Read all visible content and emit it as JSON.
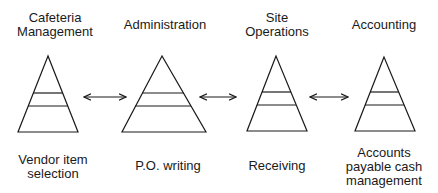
{
  "diagram": {
    "type": "linked-pyramids",
    "stroke_color": "#1a1a1a",
    "background": "#ffffff",
    "columns": [
      {
        "top_label": "Cafeteria\nManagement",
        "bottom_label": "Vendor item\nselection"
      },
      {
        "top_label": "Administration",
        "bottom_label": "P.O. writing"
      },
      {
        "top_label": "Site\nOperations",
        "bottom_label": "Receiving"
      },
      {
        "top_label": "Accounting",
        "bottom_label": "Accounts\npayable cash\nmanagement"
      }
    ],
    "connectors": [
      {
        "from": "Cafeteria Management",
        "to": "Administration",
        "style": "double-headed-arrow"
      },
      {
        "from": "Administration",
        "to": "Site Operations",
        "style": "double-headed-arrow"
      },
      {
        "from": "Site Operations",
        "to": "Accounting",
        "style": "double-headed-arrow"
      }
    ]
  }
}
